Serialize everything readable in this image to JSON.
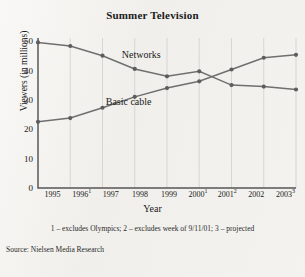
{
  "figure": {
    "source_note": "Source: Nielsen Media Research",
    "footnote": "1 – excludes Olympics; 2 – excludes week of 9/11/01; 3 – projected"
  },
  "chart_data": {
    "type": "line",
    "title": "Summer Television",
    "xlabel": "Year",
    "ylabel": "Viewers (in millions)",
    "x": [
      1995,
      1996,
      1997,
      1998,
      1999,
      2000,
      2001,
      2002,
      2003
    ],
    "categories": [
      "1995",
      "1996",
      "1997",
      "1998",
      "1999",
      "2000",
      "2001",
      "2002",
      "2003"
    ],
    "tick_labels": [
      "1995",
      "1996",
      "1997",
      "1998",
      "1999",
      "2000",
      "2001",
      "2002",
      "2003"
    ],
    "tick_superscripts": [
      "",
      "1",
      "",
      "",
      "",
      "1",
      "2",
      "",
      "3"
    ],
    "ylim": [
      0,
      50
    ],
    "yticks": [
      0,
      10,
      20,
      30,
      40,
      50
    ],
    "ytick_labels": [
      "0",
      "10",
      "20",
      "30",
      "40",
      "50"
    ],
    "grid": "vertical",
    "legend": "inline-labels",
    "series": [
      {
        "name": "Networks",
        "values": [
          49.5,
          48.3,
          45.0,
          40.5,
          38.0,
          39.7,
          35.0,
          34.5,
          33.5
        ],
        "color": "#6f6f6f",
        "label_x": 1997.6,
        "label_y": 44.2
      },
      {
        "name": "Basic cable",
        "values": [
          22.5,
          23.8,
          27.3,
          31.0,
          34.0,
          36.3,
          40.3,
          44.3,
          45.3
        ],
        "color": "#6f6f6f",
        "label_x": 1997.1,
        "label_y": 28.3
      }
    ]
  }
}
